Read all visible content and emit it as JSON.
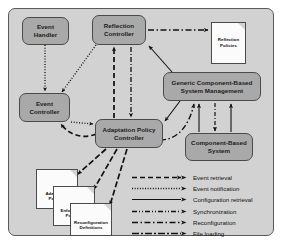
{
  "diagram": {
    "panel": {
      "background": "#d2d2d2",
      "border": "#5a5a5a"
    },
    "node_fill": "#a9a9a9",
    "doc_fill": "#fbfbfb",
    "nodes": [
      {
        "id": "event-handler",
        "lines": [
          "Event",
          "Handler"
        ],
        "x": 22,
        "y": 17,
        "w": 47,
        "h": 28
      },
      {
        "id": "reflection-controller",
        "lines": [
          "Reflection",
          "Controller"
        ],
        "x": 92,
        "y": 15,
        "w": 54,
        "h": 30
      },
      {
        "id": "generic-component-based-system-management",
        "lines": [
          "Generic Component-Based",
          "System Management"
        ],
        "x": 163,
        "y": 72,
        "w": 98,
        "h": 29
      },
      {
        "id": "event-controller",
        "lines": [
          "Event",
          "Controller"
        ],
        "x": 19,
        "y": 93,
        "w": 51,
        "h": 29
      },
      {
        "id": "adaptation-policy-controller",
        "lines": [
          "Adaptation Policy",
          "Controller"
        ],
        "x": 95,
        "y": 119,
        "w": 68,
        "h": 29
      },
      {
        "id": "component-based-system",
        "lines": [
          "Component-Based",
          "System"
        ],
        "x": 185,
        "y": 133,
        "w": 68,
        "h": 28
      }
    ],
    "documents": [
      {
        "id": "reflection-policies",
        "lines": [
          "Reflection",
          "Policies"
        ],
        "x": 211,
        "y": 22,
        "w": 35,
        "h": 42
      },
      {
        "id": "adaptation-policies",
        "lines": [
          "Adaptation",
          "Policies"
        ],
        "x": 36,
        "y": 169,
        "w": 42,
        "h": 40
      },
      {
        "id": "enforcement-policies",
        "lines": [
          "Enforcement",
          "Policies"
        ],
        "x": 53,
        "y": 186,
        "w": 42,
        "h": 40
      },
      {
        "id": "reconfiguration-definitions",
        "lines": [
          "Reconfiguration",
          "Definitions"
        ],
        "x": 70,
        "y": 203,
        "w": 42,
        "h": 33
      }
    ],
    "legend": {
      "items": [
        {
          "id": "event-retrieval",
          "label": "Event retrieval",
          "style": "dashed",
          "dasharray": "5,3",
          "width": 1.6
        },
        {
          "id": "event-notification",
          "label": "Event notification",
          "style": "dotted",
          "dasharray": "1,1.6",
          "width": 1.3
        },
        {
          "id": "configuration-retrieval",
          "label": "Configuration retrieval",
          "style": "solid",
          "dasharray": "none",
          "width": 1.1
        },
        {
          "id": "synchronization",
          "label": "Synchronization",
          "style": "dash-dot-dot",
          "dasharray": "5,2,1,2,1,2",
          "width": 1.4
        },
        {
          "id": "reconfiguration",
          "label": "Reconfiguration",
          "style": "dash-dot",
          "dasharray": "6,2.5,1.5,2.5",
          "width": 1.5
        },
        {
          "id": "file-loading",
          "label": "File loading",
          "style": "long-dash-dot",
          "dasharray": "7,2,2,2",
          "width": 1.7
        }
      ]
    },
    "edges": [
      {
        "id": "event-handler-to-event-controller",
        "kind": "event-notification"
      },
      {
        "id": "reflection-controller-to-event-controller",
        "kind": "event-notification"
      },
      {
        "id": "event-controller-to-adaptation-policy-controller",
        "kind": "event-notification"
      },
      {
        "id": "adaptation-policy-controller-to-event-controller",
        "kind": "event-retrieval"
      },
      {
        "id": "adaptation-policy-controller-to-reflection-controller",
        "kind": "event-retrieval"
      },
      {
        "id": "reflection-controller-to-adaptation-policy-controller",
        "kind": "synchronization"
      },
      {
        "id": "reflection-controller-to-reflection-policies",
        "kind": "reconfiguration"
      },
      {
        "id": "gcbsm-to-reflection-controller",
        "kind": "configuration-retrieval"
      },
      {
        "id": "gcbsm-to-adaptation-policy-controller",
        "kind": "configuration-retrieval"
      },
      {
        "id": "adaptation-policy-controller-to-gcbsm",
        "kind": "reconfiguration"
      },
      {
        "id": "cbs-to-gcbsm-left",
        "kind": "configuration-retrieval"
      },
      {
        "id": "cbs-to-gcbsm-right",
        "kind": "configuration-retrieval"
      },
      {
        "id": "gcbsm-to-cbs",
        "kind": "synchronization"
      },
      {
        "id": "adaptation-policy-controller-to-adaptation-policies",
        "kind": "file-loading"
      },
      {
        "id": "adaptation-policy-controller-to-enforcement-policies",
        "kind": "file-loading"
      },
      {
        "id": "adaptation-policy-controller-to-reconfiguration-definitions",
        "kind": "file-loading"
      }
    ]
  }
}
